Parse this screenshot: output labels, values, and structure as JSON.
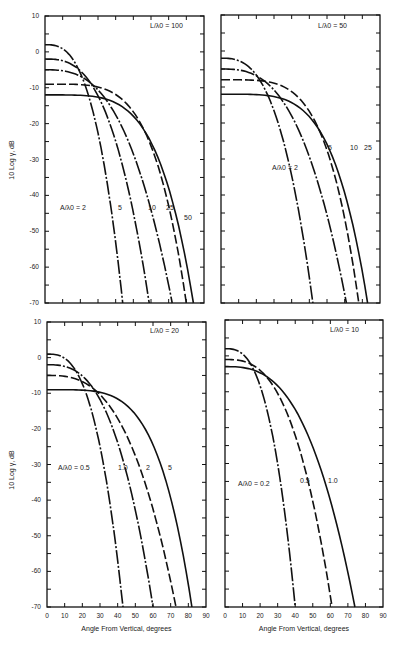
{
  "chart_data": [
    {
      "type": "line",
      "panel": "top-left",
      "annotation": "L/λ0 = 100",
      "series_label": "A/λ0",
      "xlabel": "",
      "ylabel": "10 Log γ, dB",
      "xlim": [
        0,
        90
      ],
      "ylim": [
        -70,
        10
      ],
      "yticks": [
        10,
        0,
        -10,
        -20,
        -30,
        -40,
        -50,
        -60,
        -70
      ],
      "series": [
        {
          "name": "A/λ0 = 2",
          "style": "dashdot",
          "start_db": 2,
          "x_at_minus70": 44
        },
        {
          "name": "5",
          "style": "dashdot",
          "start_db": -2,
          "x_at_minus70": 59
        },
        {
          "name": "10",
          "style": "dashdot",
          "start_db": -5,
          "x_at_minus70": 72
        },
        {
          "name": "25",
          "style": "dash",
          "start_db": -9,
          "x_at_minus70": 80
        },
        {
          "name": "50",
          "style": "solid",
          "start_db": -12,
          "x_at_minus70": 84
        }
      ]
    },
    {
      "type": "line",
      "panel": "top-right",
      "annotation": "L/λ0 = 50",
      "series_label": "A/λ0",
      "xlim": [
        0,
        90
      ],
      "ylim": [
        -70,
        10
      ],
      "series": [
        {
          "name": "A/λ0 = 2",
          "style": "dashdot",
          "start_db": -2,
          "x_at_minus70": 52
        },
        {
          "name": "5",
          "style": "dashdot",
          "start_db": -5,
          "x_at_minus70": 71
        },
        {
          "name": "10",
          "style": "dash",
          "start_db": -8,
          "x_at_minus70": 78
        },
        {
          "name": "25",
          "style": "solid",
          "start_db": -12,
          "x_at_minus70": 83
        }
      ]
    },
    {
      "type": "line",
      "panel": "bottom-left",
      "annotation": "L/λ0 = 20",
      "series_label": "A/λ0",
      "xlabel": "Angle From Vertical, degrees",
      "ylabel": "10 Log γ, dB",
      "xlim": [
        0,
        90
      ],
      "ylim": [
        -70,
        10
      ],
      "xticks": [
        0,
        10,
        20,
        30,
        40,
        50,
        60,
        70,
        80,
        90
      ],
      "yticks": [
        10,
        0,
        -10,
        -20,
        -30,
        -40,
        -50,
        -60,
        -70
      ],
      "series": [
        {
          "name": "A/λ0 = 0.5",
          "style": "dashdot",
          "start_db": 1,
          "x_at_minus70": 43
        },
        {
          "name": "1.0",
          "style": "dashdot",
          "start_db": -2,
          "x_at_minus70": 60
        },
        {
          "name": "2",
          "style": "dash",
          "start_db": -5,
          "x_at_minus70": 73
        },
        {
          "name": "5",
          "style": "solid",
          "start_db": -9,
          "x_at_minus70": 82
        }
      ]
    },
    {
      "type": "line",
      "panel": "bottom-right",
      "annotation": "L/λ0 = 10",
      "series_label": "A/λ0",
      "xlabel": "Angle From Vertical, degrees",
      "xlim": [
        0,
        90
      ],
      "ylim": [
        -70,
        10
      ],
      "xticks": [
        0,
        10,
        20,
        30,
        40,
        50,
        60,
        70,
        80,
        90
      ],
      "series": [
        {
          "name": "A/λ0 = 0.2",
          "style": "dashdot",
          "start_db": 2,
          "x_at_minus70": 40
        },
        {
          "name": "0.5",
          "style": "dash",
          "start_db": -1,
          "x_at_minus70": 61
        },
        {
          "name": "1.0",
          "style": "solid",
          "start_db": -3,
          "x_at_minus70": 74
        }
      ]
    }
  ],
  "labels": {
    "ylabel": "10 Log γ, dB",
    "xlabel": "Angle From Vertical, degrees",
    "yticks": [
      "10",
      "0",
      "-10",
      "-20",
      "-30",
      "-40",
      "-50",
      "-60",
      "-70"
    ],
    "xticks": [
      "0",
      "10",
      "20",
      "30",
      "40",
      "50",
      "60",
      "70",
      "80",
      "90"
    ],
    "p1": {
      "ann": "L/λ0 = 100",
      "c": [
        "A/λ0 = 2",
        "5",
        "10",
        "25",
        "50"
      ]
    },
    "p2": {
      "ann": "L/λ0 = 50",
      "c": [
        "A/λ0 = 2",
        "5",
        "10",
        "25"
      ]
    },
    "p3": {
      "ann": "L/λ0 = 20",
      "c": [
        "A/λ0 = 0.5",
        "1.0",
        "2",
        "5"
      ]
    },
    "p4": {
      "ann": "L/λ0 = 10",
      "c": [
        "A/λ0 = 0.2",
        "0.5",
        "1.0"
      ]
    }
  }
}
